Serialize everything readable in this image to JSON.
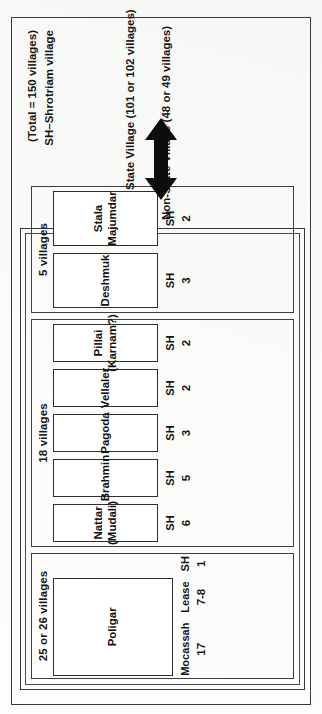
{
  "diagram": {
    "notes": {
      "total": "(Total = 150 villages)",
      "abbreviation": "SH–Shrotriam village"
    },
    "axis": {
      "state_village": "State Village (101 or 102 villages)",
      "non_state_village": "Non-State Village (48 or 49 villages)",
      "arrow": "double-headed-arrow"
    },
    "groups": [
      {
        "id": "group-25",
        "label": "25 or 26 villages",
        "tenures": [
          {
            "name": "Poligar",
            "sub": "",
            "metrics": [
              {
                "label": "Mocassah",
                "value": "17"
              },
              {
                "label": "Lease",
                "value": "7-8"
              },
              {
                "label": "SH",
                "value": "1"
              }
            ]
          }
        ]
      },
      {
        "id": "group-18",
        "label": "18 villages",
        "tenures": [
          {
            "name": "Nattar",
            "sub": "(Mudali)",
            "metrics": [
              {
                "label": "SH",
                "value": "6"
              }
            ]
          },
          {
            "name": "Brahmin",
            "sub": "",
            "metrics": [
              {
                "label": "SH",
                "value": "5"
              }
            ]
          },
          {
            "name": "Pagoda",
            "sub": "",
            "metrics": [
              {
                "label": "SH",
                "value": "3"
              }
            ]
          },
          {
            "name": "Vellaler",
            "sub": "",
            "metrics": [
              {
                "label": "SH",
                "value": "2"
              }
            ]
          },
          {
            "name": "Pillai",
            "sub": "(Karnam?)",
            "metrics": [
              {
                "label": "SH",
                "value": "2"
              }
            ]
          }
        ]
      },
      {
        "id": "group-5",
        "label": "5 villages",
        "tenures": [
          {
            "name": "Deshmuk",
            "sub": "",
            "metrics": [
              {
                "label": "SH",
                "value": "3"
              }
            ]
          },
          {
            "name": "Stala",
            "sub": "Majumdar",
            "metrics": [
              {
                "label": "SH",
                "value": "2"
              }
            ]
          }
        ]
      }
    ],
    "colors": {
      "ink": "#151515",
      "rule": "#3a3a3a",
      "paper": "#fdfdfd"
    }
  }
}
